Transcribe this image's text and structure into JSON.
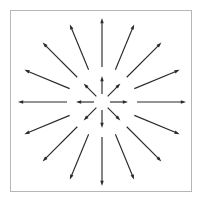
{
  "figure": {
    "type": "radial-arrow-burst",
    "canvas": {
      "width": 202,
      "height": 206,
      "background": "#ffffff"
    },
    "border": {
      "x": 10.5,
      "y": 10.5,
      "width": 181,
      "height": 181,
      "stroke": "#b6b6b6",
      "stroke_width": 1,
      "fill": "none"
    },
    "center": {
      "x": 102,
      "y": 102
    },
    "stroke_color": "#2a2a2a",
    "arrowhead": {
      "length": 5.2,
      "half_width": 1.7,
      "fill": "#2a2a2a"
    },
    "rings": [
      {
        "name": "inner-ring",
        "count": 8,
        "angle_step_deg": 45,
        "angle_offset_deg": 0,
        "radius_start": 8,
        "radius_end": 26,
        "stroke_width": 1.15,
        "direction": "outward"
      },
      {
        "name": "outer-ring",
        "count": 16,
        "angle_step_deg": 22.5,
        "angle_offset_deg": 0,
        "radius_start": 35,
        "radius_end": 84,
        "stroke_width": 1.15,
        "direction": "outward"
      }
    ]
  }
}
